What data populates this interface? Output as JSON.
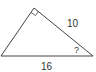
{
  "diagram": {
    "shape": "right triangle",
    "right_angle_marker": true,
    "labels": {
      "hypotenuse_side": "10",
      "angle_unknown": "?",
      "base": "16"
    },
    "colors": {
      "stroke": "#444444",
      "text": "#333333",
      "background": "#ffffff"
    }
  }
}
